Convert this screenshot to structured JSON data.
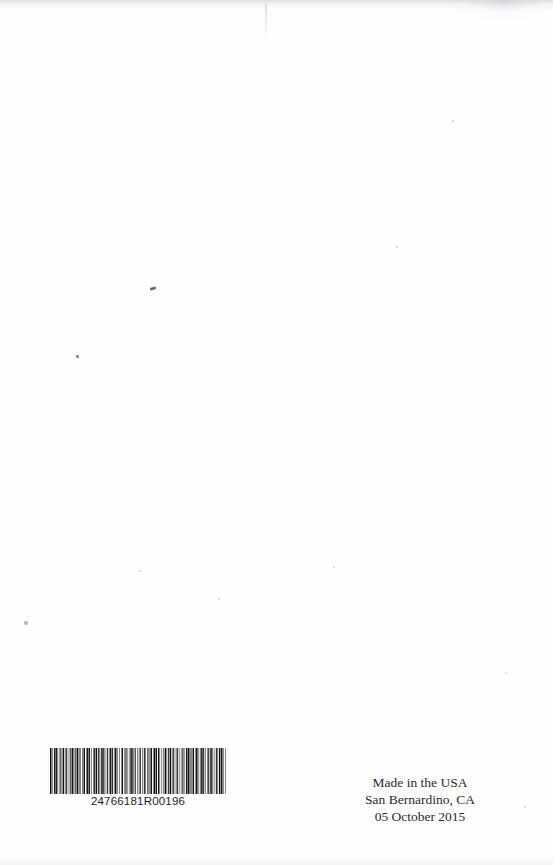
{
  "page": {
    "kind": "scanned-book-back-cover",
    "background_color": "#fefefe",
    "width": 553,
    "height": 865
  },
  "barcode": {
    "symbology_label": "code-128-barcode",
    "human_readable_number": "24766181R00196",
    "bar_color": "#121214",
    "background_color": "#fefefe",
    "bar_pattern": [
      3,
      2,
      1,
      2,
      3,
      1,
      2,
      1,
      1,
      3,
      2,
      2,
      1,
      1,
      3,
      2,
      1,
      1,
      2,
      3,
      1,
      2,
      2,
      1,
      3,
      1,
      1,
      2,
      2,
      1,
      3,
      2,
      1,
      1,
      1,
      3,
      2,
      1,
      2,
      2,
      1,
      1,
      3,
      1,
      2,
      2,
      1,
      3,
      1,
      1,
      2,
      1,
      3,
      2,
      2,
      1,
      1,
      2,
      3,
      1,
      2,
      1,
      1,
      3,
      2,
      2,
      1,
      1,
      3,
      1,
      2,
      2,
      1,
      1,
      3,
      2,
      1,
      2,
      1,
      3,
      1,
      1,
      2,
      3,
      2,
      1,
      1,
      2,
      1,
      3,
      2,
      1,
      3,
      1,
      1,
      2,
      2,
      3,
      1,
      2,
      1,
      1,
      2,
      3,
      1,
      2,
      2,
      1,
      1,
      3,
      2,
      1,
      1,
      2,
      3,
      2,
      1,
      1,
      2,
      1,
      3,
      2,
      2,
      1,
      1,
      3,
      1,
      2,
      1,
      2,
      3,
      1,
      1,
      2,
      2,
      1,
      3,
      2,
      1,
      1,
      2,
      3,
      1,
      1,
      2,
      2,
      1,
      3,
      1,
      2,
      2,
      1,
      1,
      3,
      2,
      1,
      3,
      1,
      2,
      1,
      1,
      2,
      3,
      2,
      1,
      1,
      3,
      2,
      1,
      2,
      1,
      1,
      3,
      1,
      2,
      2,
      1,
      3,
      1,
      1,
      2,
      2,
      3,
      1,
      1,
      2,
      1,
      3,
      2,
      1,
      1,
      2,
      3,
      1,
      2,
      1,
      2,
      3,
      1,
      1
    ]
  },
  "imprint": {
    "lines": [
      "Made in the USA",
      "San Bernardino, CA",
      "05 October 2015"
    ],
    "line_1": "Made in the USA",
    "line_2": "San Bernardino, CA",
    "line_3": "05 October 2015",
    "text_color": "#2a2a2c"
  }
}
